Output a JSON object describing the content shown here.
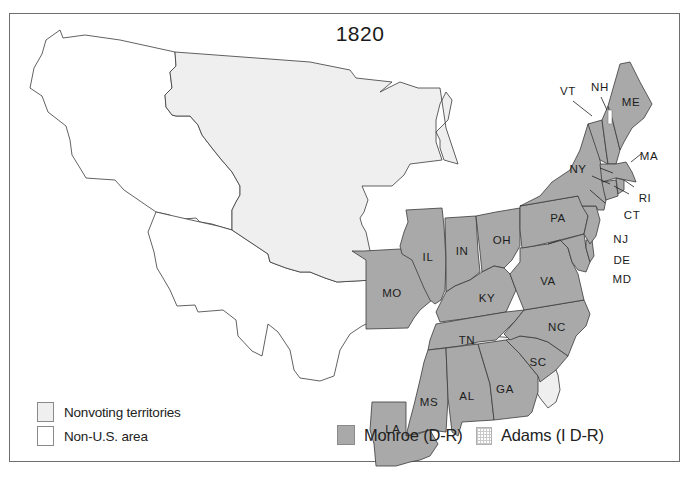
{
  "map": {
    "title": "1820",
    "colors": {
      "monroe": "#a9a9a9",
      "nonvoting": "#efefef",
      "non_us": "#ffffff",
      "border": "#3a3a3a",
      "frame": "#6e6e6e"
    },
    "states": [
      {
        "abbr": "ME",
        "winner": "Monroe (D-R)"
      },
      {
        "abbr": "NH",
        "winner": "Monroe (D-R)"
      },
      {
        "abbr": "VT",
        "winner": "Monroe (D-R)"
      },
      {
        "abbr": "MA",
        "winner": "Monroe (D-R)"
      },
      {
        "abbr": "RI",
        "winner": "Monroe (D-R)"
      },
      {
        "abbr": "CT",
        "winner": "Monroe (D-R)"
      },
      {
        "abbr": "NY",
        "winner": "Monroe (D-R)"
      },
      {
        "abbr": "NJ",
        "winner": "Monroe (D-R)"
      },
      {
        "abbr": "PA",
        "winner": "Monroe (D-R)"
      },
      {
        "abbr": "DE",
        "winner": "Monroe (D-R)"
      },
      {
        "abbr": "MD",
        "winner": "Monroe (D-R)"
      },
      {
        "abbr": "VA",
        "winner": "Monroe (D-R)"
      },
      {
        "abbr": "NC",
        "winner": "Monroe (D-R)"
      },
      {
        "abbr": "SC",
        "winner": "Monroe (D-R)"
      },
      {
        "abbr": "GA",
        "winner": "Monroe (D-R)"
      },
      {
        "abbr": "OH",
        "winner": "Monroe (D-R)"
      },
      {
        "abbr": "IN",
        "winner": "Monroe (D-R)"
      },
      {
        "abbr": "IL",
        "winner": "Monroe (D-R)"
      },
      {
        "abbr": "KY",
        "winner": "Monroe (D-R)"
      },
      {
        "abbr": "TN",
        "winner": "Monroe (D-R)"
      },
      {
        "abbr": "AL",
        "winner": "Monroe (D-R)"
      },
      {
        "abbr": "MS",
        "winner": "Monroe (D-R)"
      },
      {
        "abbr": "LA",
        "winner": "Monroe (D-R)"
      },
      {
        "abbr": "MO",
        "winner": "Monroe (D-R)"
      }
    ],
    "labels": {
      "ME": "ME",
      "NH": "NH",
      "VT": "VT",
      "MA": "MA",
      "RI": "RI",
      "CT": "CT",
      "NY": "NY",
      "NJ": "NJ",
      "PA": "PA",
      "DE": "DE",
      "MD": "MD",
      "VA": "VA",
      "NC": "NC",
      "SC": "SC",
      "GA": "GA",
      "OH": "OH",
      "IN": "IN",
      "IL": "IL",
      "KY": "KY",
      "TN": "TN",
      "AL": "AL",
      "MS": "MS",
      "LA": "LA",
      "MO": "MO"
    }
  },
  "legend": {
    "nonvoting": "Nonvoting territories",
    "non_us": "Non-U.S. area",
    "monroe": "Monroe (D-R)",
    "adams": "Adams (I D-R)"
  }
}
